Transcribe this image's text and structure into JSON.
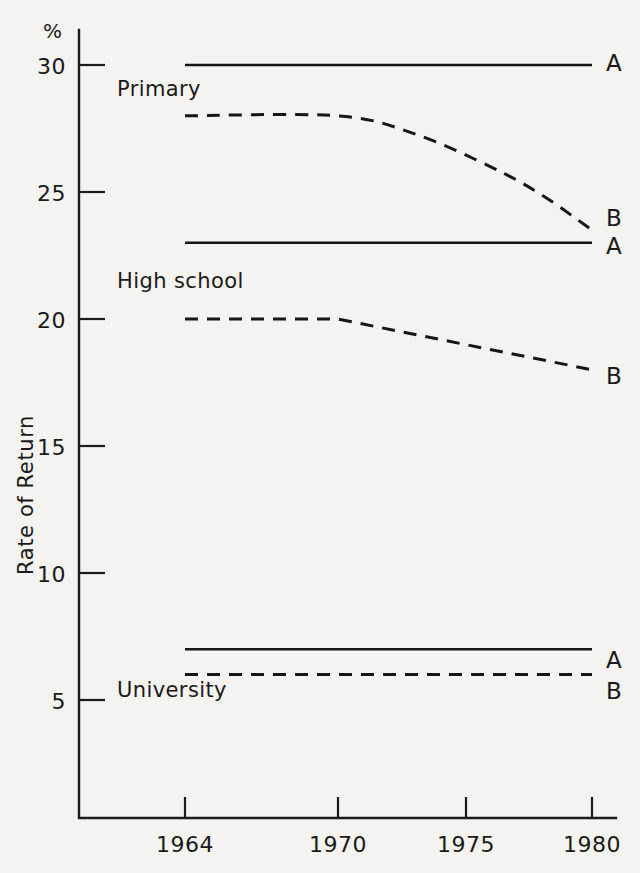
{
  "chart_data": {
    "type": "line",
    "title": "",
    "subtitle": "",
    "xlabel": "",
    "ylabel": "Rate of Return",
    "unit_label": "%",
    "x_tick_labels": [
      "1964",
      "1970",
      "1975",
      "1980"
    ],
    "x_tick_values": [
      1964,
      1970,
      1975,
      1980
    ],
    "y_tick_labels": [
      "5",
      "10",
      "15",
      "20",
      "25",
      "30"
    ],
    "y_tick_values": [
      5,
      10,
      15,
      20,
      25,
      30
    ],
    "xlim": [
      1962.5,
      1981.5
    ],
    "ylim": [
      0,
      31.5
    ],
    "grid": false,
    "legend_position": "right-inline",
    "group_labels": [
      "Primary",
      "High school",
      "University"
    ],
    "series": [
      {
        "name": "Primary A",
        "group": "Primary",
        "label": "A",
        "style": "solid",
        "x": [
          1964,
          1970,
          1975,
          1980
        ],
        "values": [
          30.0,
          30.0,
          30.0,
          30.0
        ]
      },
      {
        "name": "Primary B",
        "group": "Primary",
        "label": "B",
        "style": "dashed",
        "x": [
          1964,
          1970,
          1973,
          1976,
          1978,
          1980
        ],
        "values": [
          28.0,
          28.0,
          27.3,
          26.0,
          24.9,
          23.5
        ]
      },
      {
        "name": "High school A",
        "group": "High school",
        "label": "A",
        "style": "solid",
        "x": [
          1964,
          1970,
          1975,
          1980
        ],
        "values": [
          23.0,
          23.0,
          23.0,
          23.0
        ]
      },
      {
        "name": "High school B",
        "group": "High school",
        "label": "B",
        "style": "dashed",
        "x": [
          1964,
          1970,
          1975,
          1980
        ],
        "values": [
          20.0,
          20.0,
          19.0,
          18.0
        ]
      },
      {
        "name": "University A",
        "group": "University",
        "label": "A",
        "style": "solid",
        "x": [
          1964,
          1970,
          1975,
          1980
        ],
        "values": [
          7.0,
          7.0,
          7.0,
          7.0
        ]
      },
      {
        "name": "University B",
        "group": "University",
        "label": "B",
        "style": "dashed",
        "x": [
          1964,
          1970,
          1975,
          1980
        ],
        "values": [
          6.0,
          6.0,
          6.0,
          6.0
        ]
      }
    ]
  },
  "axes": {
    "unit": "%",
    "y_title": "Rate of  Return",
    "y_ticks": [
      {
        "label": "30",
        "value": 30
      },
      {
        "label": "25",
        "value": 25
      },
      {
        "label": "20",
        "value": 20
      },
      {
        "label": "15",
        "value": 15
      },
      {
        "label": "10",
        "value": 10
      },
      {
        "label": "5",
        "value": 5
      }
    ],
    "x_ticks": [
      {
        "label": "1964",
        "value": 1964
      },
      {
        "label": "1970",
        "value": 1970
      },
      {
        "label": "1975",
        "value": 1975
      },
      {
        "label": "1980",
        "value": 1980
      }
    ]
  },
  "annotations": {
    "primary": "Primary",
    "high_school": "High school",
    "university": "University",
    "primary_a": "A",
    "primary_b": "B",
    "highschool_a": "A",
    "highschool_b": "B",
    "university_a": "A",
    "university_b": "B"
  },
  "colors": {
    "background": "#f4f3f0",
    "ink": "#1a1a1a"
  }
}
